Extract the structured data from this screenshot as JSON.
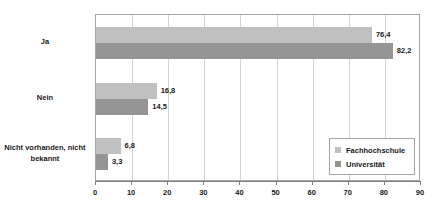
{
  "chart_data": {
    "type": "bar",
    "orientation": "horizontal",
    "title": "",
    "subtitle": "",
    "xlabel": "",
    "ylabel": "",
    "xlim": [
      0,
      90
    ],
    "xticks": [
      "0",
      "10",
      "20",
      "30",
      "40",
      "50",
      "60",
      "70",
      "80",
      "90"
    ],
    "xtick_step": 10,
    "grid": true,
    "grid_axis": "x",
    "legend_position": "bottom-right",
    "decimal_separator": ",",
    "categories": [
      "Ja",
      "Nein",
      "Nicht vorhanden, nicht bekannt"
    ],
    "category_lines": [
      [
        "Ja"
      ],
      [
        "Nein"
      ],
      [
        "Nicht vorhanden, nicht",
        "bekannt"
      ]
    ],
    "series": [
      {
        "name": "Fachhochschule",
        "color": "#c0c0c0",
        "values": [
          76.4,
          16.8,
          6.8
        ],
        "labels": [
          "76,4",
          "16,8",
          "6,8"
        ]
      },
      {
        "name": "Universität",
        "color": "#959595",
        "values": [
          82.2,
          14.5,
          3.3
        ],
        "labels": [
          "82,2",
          "14,5",
          "3,3"
        ]
      }
    ]
  },
  "legend": {
    "items": [
      {
        "label": "Fachhochschule",
        "color": "#c0c0c0"
      },
      {
        "label": "Universität",
        "color": "#959595"
      }
    ]
  },
  "axis": {
    "x_ticks": [
      {
        "label": "0",
        "value": 0
      },
      {
        "label": "10",
        "value": 10
      },
      {
        "label": "20",
        "value": 20
      },
      {
        "label": "30",
        "value": 30
      },
      {
        "label": "40",
        "value": 40
      },
      {
        "label": "50",
        "value": 50
      },
      {
        "label": "60",
        "value": 60
      },
      {
        "label": "70",
        "value": 70
      },
      {
        "label": "80",
        "value": 80
      },
      {
        "label": "90",
        "value": 90
      }
    ]
  },
  "colors": {
    "series_light": "#c0c0c0",
    "series_dark": "#959595",
    "grid": "#d3d3d3",
    "frame": "#a6a6a6",
    "axis": "#808080",
    "text": "#1a1a1a",
    "background": "#ffffff"
  }
}
